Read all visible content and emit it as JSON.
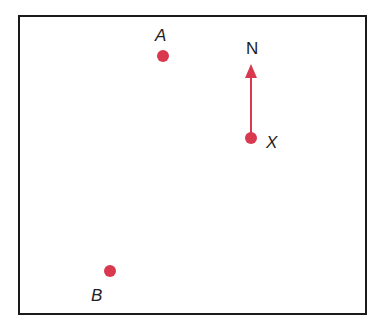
{
  "diagram": {
    "type": "map-bearing",
    "accent_color": "#d9394e",
    "compass": {
      "label": "N",
      "direction": "north",
      "origin_point": "X"
    },
    "points": [
      {
        "id": "A",
        "label": "A",
        "x": 163,
        "y": 56
      },
      {
        "id": "X",
        "label": "X",
        "x": 251,
        "y": 138
      },
      {
        "id": "B",
        "label": "B",
        "x": 110,
        "y": 271
      }
    ]
  }
}
